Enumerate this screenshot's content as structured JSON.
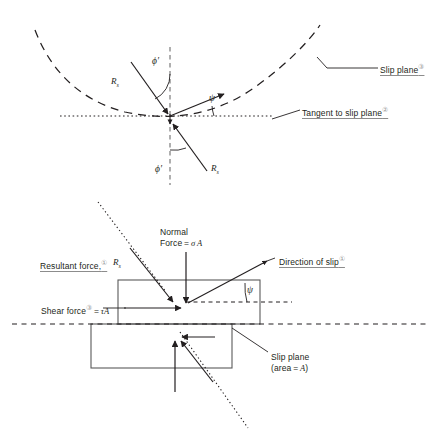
{
  "figure": {
    "ink_color": "#231f20",
    "accent_color": "#9a9a9a"
  },
  "top_diagram": {
    "name": "slip-surface-force-diagram",
    "labels": {
      "slip_plane": "Slip plane",
      "slip_plane_marker": "③",
      "tangent": "Tangent to slip plane",
      "tangent_marker": "②",
      "phi_upper": "ϕ′",
      "phi_lower": "ϕ′",
      "psi": "ψ",
      "resultant_upper": "R",
      "resultant_upper_sub": "s",
      "resultant_lower": "R",
      "resultant_lower_sub": "s"
    }
  },
  "bottom_diagram": {
    "name": "slip-block-force-diagram",
    "labels": {
      "resultant_force": "Resultant force,",
      "resultant_force_marker": "①",
      "resultant_force_symbol": "R",
      "resultant_force_symbol_sub": "s",
      "normal_force_line1": "Normal",
      "normal_force_line2_prefix": "Force = ",
      "normal_force_line2_symbol": "σ",
      "normal_force_line2_suffix": "A",
      "shear_force_prefix": "Shear force",
      "shear_force_marker": "③",
      "shear_force_eq": " = ",
      "shear_force_symbol": "τ",
      "shear_force_area": "A",
      "direction_of_slip": "Direction of slip",
      "direction_of_slip_marker": "①",
      "psi": "ψ",
      "slip_plane_line1": "Slip plane",
      "slip_plane_line2_prefix": "(area = ",
      "slip_plane_line2_symbol": "A",
      "slip_plane_line2_suffix": ")"
    }
  }
}
